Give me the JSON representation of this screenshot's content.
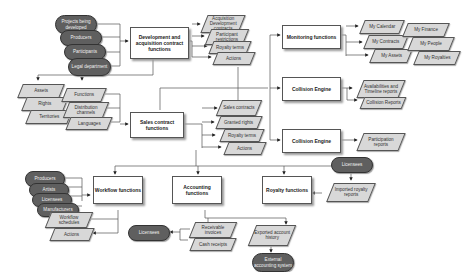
{
  "diagram": {
    "top_left_sources": [
      "Projects being developed",
      "Producers",
      "Participants",
      "Legal department"
    ],
    "dev_function": "Development and acquisition contract functions",
    "dev_outputs": [
      "Acquisition Development contracts",
      "Participant restrictions",
      "Royalty terms",
      "Actions"
    ],
    "left_inputs_a": [
      "Assets",
      "Rights",
      "Territories"
    ],
    "left_inputs_b": [
      "Functions",
      "Distribution channels",
      "Languages"
    ],
    "sales_function": "Sales contract functions",
    "sales_outputs": [
      "Sales contracts",
      "Granted rights",
      "Royalty terms",
      "Actions"
    ],
    "monitoring_function": "Monitoring functions",
    "monitoring_outputs_a": [
      "My Calendar",
      "My Contracts",
      "My Assets"
    ],
    "monitoring_outputs_b": [
      "My Finance",
      "My People",
      "My Royalties"
    ],
    "collision_engine_1": "Collision Engine",
    "collision_outputs_1": [
      "Availabilities and Timeline reports",
      "Collision Reports"
    ],
    "collision_engine_2": "Collision Engine",
    "collision_outputs_2": [
      "Participation reports"
    ],
    "workflow_sources": [
      "Producers",
      "Artists",
      "Licensees",
      "Manufacturers"
    ],
    "workflow_function": "Workflow functions",
    "workflow_outputs": [
      "Workflow schedules",
      "Actions"
    ],
    "accounting_function": "Accounting functions",
    "accounting_outputs": [
      "Receivable invoices",
      "Cash receipts"
    ],
    "accounting_target": "Licensees",
    "royalty_function": "Royalty functions",
    "royalty_source": "Licensees",
    "royalty_input": "Imported royalty reports",
    "royalty_output": "Exported account history",
    "royalty_target": "External accounting system"
  }
}
